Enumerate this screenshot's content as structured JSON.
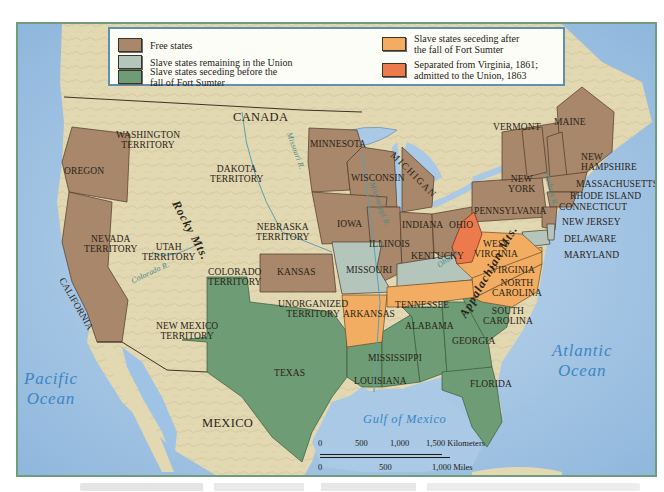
{
  "legend": {
    "items": [
      {
        "label": "Free states",
        "color": "#a8876a"
      },
      {
        "label": "Slave states remaining in the Union",
        "color": "#b4c6bc"
      },
      {
        "label": "Slave states seceding before the\nfall of Fort Sumter",
        "color": "#6e9c74"
      },
      {
        "label": "Slave states seceding after\nthe fall of Fort Sumter",
        "color": "#f2ad62"
      },
      {
        "label": "Separated from Virginia, 1861;\nadmitted to the Union, 1863",
        "color": "#ec7a4c"
      }
    ]
  },
  "colors": {
    "ocean": "#a9c9e6",
    "land": "#e2d8b2",
    "free": "#a8876a",
    "border_slave": "#b4c6bc",
    "confederate_early": "#6e9c74",
    "confederate_late": "#f2ad62",
    "west_virginia": "#ec7a4c",
    "frame": "#6e9c7d",
    "legend_border": "#5e8fb4",
    "water_label": "#3c86c4"
  },
  "labels": {
    "countries": {
      "canada": "CANADA",
      "mexico": "MEXICO"
    },
    "water": {
      "pacific": "Pacific\nOcean",
      "atlantic": "Atlantic\nOcean",
      "gulf": "Gulf of Mexico"
    },
    "mountains": {
      "rocky": "Rocky Mts.",
      "appalachian": "Appalachian Mts."
    },
    "rivers": {
      "missouri": "Missouri R.",
      "mississippi": "Mississippi R.",
      "ohio": "Ohio R.",
      "colorado": "Colorado R.",
      "hudson": "Hudson R."
    },
    "territories": {
      "washington": "WASHINGTON\nTERRITORY",
      "dakota": "DAKOTA\nTERRITORY",
      "nebraska": "NEBRASKA\nTERRITORY",
      "nevada": "NEVADA\nTERRITORY",
      "utah": "UTAH\nTERRITORY",
      "colorado": "COLORADO\nTERRITORY",
      "unorganized": "UNORGANIZED\nTERRITORY",
      "new_mexico": "NEW MEXICO\nTERRITORY"
    },
    "states": {
      "oregon": "OREGON",
      "california": "CALIFORNIA",
      "minnesota": "MINNESOTA",
      "wisconsin": "WISCONSIN",
      "michigan": "MICHIGAN",
      "iowa": "IOWA",
      "illinois": "ILLINOIS",
      "indiana": "INDIANA",
      "ohio": "OHIO",
      "kansas": "KANSAS",
      "pennsylvania": "PENNSYLVANIA",
      "new_york": "NEW\nYORK",
      "vermont": "VERMONT",
      "maine": "MAINE",
      "new_hampshire": "NEW\nHAMPSHIRE",
      "massachusetts": "MASSACHUSETTS",
      "rhode_island": "RHODE ISLAND",
      "connecticut": "CONNECTICUT",
      "new_jersey": "NEW JERSEY",
      "delaware": "DELAWARE",
      "maryland": "MARYLAND",
      "west_virginia": "WEST\nVIRGINIA",
      "virginia": "VIRGINIA",
      "kentucky": "KENTUCKY",
      "missouri": "MISSOURI",
      "tennessee": "TENNESSEE",
      "north_carolina": "NORTH\nCAROLINA",
      "south_carolina": "SOUTH\nCAROLINA",
      "arkansas": "ARKANSAS",
      "alabama": "ALABAMA",
      "georgia": "GEORGIA",
      "mississippi": "MISSISSIPPI",
      "louisiana": "LOUISIANA",
      "florida": "FLORIDA",
      "texas": "TEXAS"
    }
  },
  "scale": {
    "km_ticks": [
      "0",
      "500",
      "1,000",
      "1,500 Kilometers"
    ],
    "mile_ticks": [
      "0",
      "500",
      "1,000 Miles"
    ]
  }
}
